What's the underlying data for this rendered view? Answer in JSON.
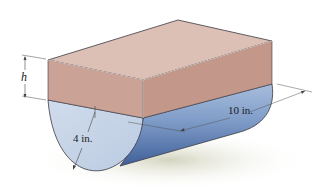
{
  "figure": {
    "labels": {
      "height": "h",
      "radius": "4 in.",
      "length": "10 in."
    },
    "colors": {
      "block_top": "#dcbfb4",
      "block_front": "#c9a195",
      "block_side": "#c29587",
      "cylinder_face": "#c3d2e6",
      "cylinder_side_light": "#9db4d6",
      "cylinder_side_dark": "#4d6fa6",
      "shadow": "#dcdccb",
      "edge": "#3a3a44",
      "dimension_line": "#555555"
    }
  }
}
